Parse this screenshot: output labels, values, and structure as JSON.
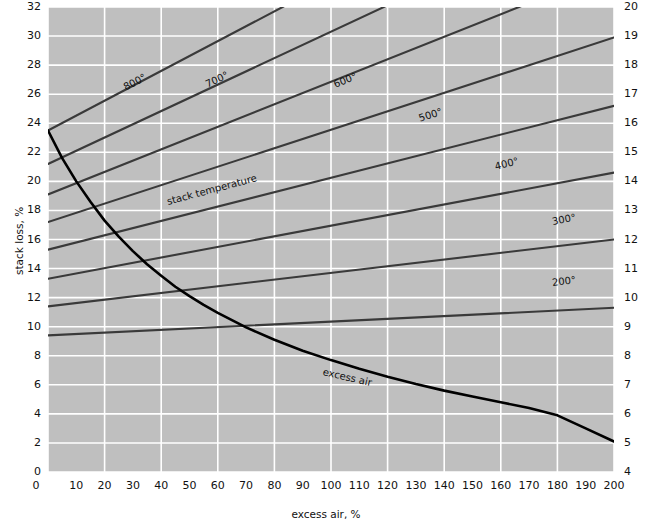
{
  "chart_data": {
    "type": "line",
    "title": "",
    "xlabel": "excess air, %",
    "ylabel_left": "stack loss, %",
    "ylabel_right": "",
    "xlim": [
      0,
      200
    ],
    "ylim_left": [
      0,
      32
    ],
    "ylim_right": [
      4,
      20
    ],
    "grid": true,
    "legend_position": "inline-labels",
    "plot_background": "#bfbfbf",
    "gridline_color": "#ffffff",
    "line_color": "#3a3a3a",
    "curve_color": "#000000",
    "xticks": [
      0,
      10,
      20,
      30,
      40,
      50,
      60,
      70,
      80,
      90,
      100,
      110,
      120,
      130,
      140,
      150,
      160,
      170,
      180,
      190,
      200
    ],
    "yticks_left": [
      0,
      2,
      4,
      6,
      8,
      10,
      12,
      14,
      16,
      18,
      20,
      22,
      24,
      26,
      28,
      30,
      32
    ],
    "yticks_right": [
      4,
      5,
      6,
      7,
      8,
      9,
      10,
      11,
      12,
      13,
      14,
      15,
      16,
      17,
      18,
      19,
      20
    ],
    "xgridlines": [
      0,
      20,
      40,
      60,
      80,
      100,
      120,
      140,
      160,
      180,
      200
    ],
    "ygridlines_left": [
      0,
      2,
      4,
      6,
      8,
      10,
      12,
      14,
      16,
      18,
      20,
      22,
      24,
      26,
      28,
      30,
      32
    ],
    "annotations": [
      {
        "text": "stack temperature",
        "x": 42,
        "y": 18.6,
        "rotation": -15
      },
      {
        "text": "excess air",
        "x": 97,
        "y": 6.9,
        "rotation": 13
      }
    ],
    "series": [
      {
        "name": "800°",
        "label": "800°",
        "label_x": 27,
        "label_y": 26.4,
        "points": [
          [
            0,
            23.5
          ],
          [
            200,
            44.0
          ]
        ]
      },
      {
        "name": "700°",
        "label": "700°",
        "label_x": 56,
        "label_y": 26.6,
        "points": [
          [
            0,
            21.2
          ],
          [
            200,
            39.4
          ]
        ]
      },
      {
        "name": "600°",
        "label": "600°",
        "label_x": 101,
        "label_y": 26.6,
        "points": [
          [
            0,
            19.1
          ],
          [
            200,
            34.6
          ]
        ]
      },
      {
        "name": "500°",
        "label": "500°",
        "label_x": 131,
        "label_y": 24.3,
        "points": [
          [
            0,
            17.2
          ],
          [
            200,
            29.9
          ]
        ]
      },
      {
        "name": "400°",
        "label": "400°",
        "label_x": 158,
        "label_y": 21.0,
        "points": [
          [
            0,
            15.3
          ],
          [
            200,
            25.2
          ]
        ]
      },
      {
        "name": "300°",
        "label": "300°",
        "label_x": 178,
        "label_y": 17.2,
        "points": [
          [
            0,
            13.3
          ],
          [
            200,
            20.6
          ]
        ]
      },
      {
        "name": "200°",
        "label": "200°",
        "label_x": 178,
        "label_y": 13.0,
        "points": [
          [
            0,
            11.4
          ],
          [
            200,
            16.0
          ]
        ]
      },
      {
        "name": "baseline",
        "label": "",
        "label_x": null,
        "label_y": null,
        "points": [
          [
            0,
            9.4
          ],
          [
            200,
            11.3
          ]
        ]
      },
      {
        "name": "excess air",
        "label": "",
        "label_x": null,
        "label_y": null,
        "curve": true,
        "points": [
          [
            0,
            23.5
          ],
          [
            5,
            21.6
          ],
          [
            10,
            20.0
          ],
          [
            15,
            18.6
          ],
          [
            20,
            17.3
          ],
          [
            25,
            16.2
          ],
          [
            30,
            15.2
          ],
          [
            35,
            14.3
          ],
          [
            40,
            13.5
          ],
          [
            45,
            12.75
          ],
          [
            50,
            12.1
          ],
          [
            55,
            11.5
          ],
          [
            60,
            10.95
          ],
          [
            65,
            10.45
          ],
          [
            70,
            9.95
          ],
          [
            80,
            9.1
          ],
          [
            90,
            8.35
          ],
          [
            100,
            7.7
          ],
          [
            110,
            7.1
          ],
          [
            120,
            6.55
          ],
          [
            130,
            6.05
          ],
          [
            140,
            5.6
          ],
          [
            150,
            5.2
          ],
          [
            160,
            4.8
          ],
          [
            170,
            4.4
          ],
          [
            180,
            3.9
          ],
          [
            190,
            3.0
          ],
          [
            200,
            2.1
          ]
        ]
      }
    ]
  },
  "axes": {
    "x_title": "excess air, %",
    "y_left_title": "stack loss, %",
    "x_tick_labels": [
      "0",
      "10",
      "20",
      "30",
      "40",
      "50",
      "60",
      "70",
      "80",
      "90",
      "100",
      "110",
      "120",
      "130",
      "140",
      "150",
      "160",
      "170",
      "180",
      "190",
      "200"
    ],
    "y_left_tick_labels": [
      "32",
      "30",
      "28",
      "26",
      "24",
      "22",
      "20",
      "18",
      "16",
      "14",
      "12",
      "10",
      "8",
      "6",
      "4",
      "2",
      "0"
    ],
    "y_right_tick_labels": [
      "20",
      "19",
      "18",
      "17",
      "16",
      "15",
      "14",
      "13",
      "12",
      "11",
      "10",
      "9",
      "8",
      "7",
      "6",
      "5",
      "4"
    ]
  }
}
